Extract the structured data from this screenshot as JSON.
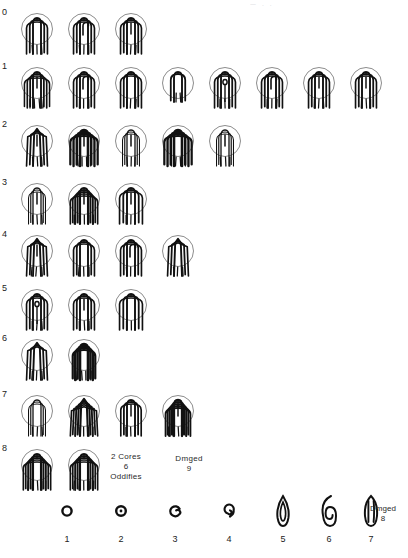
{
  "document": {
    "title": "Fingerprint ridge-pattern classification sheet",
    "top_edge_marks": "— .          .",
    "ink_color": "#111111",
    "circle_color": "#6f6f6f",
    "paper_color": "#ffffff"
  },
  "rows": [
    {
      "label": "0",
      "top": 8,
      "count": 3,
      "variants": [
        "loop-plain",
        "loop-hook",
        "loop-double-rod"
      ]
    },
    {
      "label": "1",
      "top": 62,
      "count": 8,
      "variants": [
        "loop-triple-rod",
        "loop-hook-rods",
        "loop-nested-arch",
        "loop-short-plain",
        "loop-eye-core",
        "loop-hook-left",
        "loop-rod-core",
        "loop-spiral-core"
      ]
    },
    {
      "label": "2",
      "top": 120,
      "count": 5,
      "variants": [
        "arch-tented-rods",
        "arch-heavy-rods",
        "loop-thin-rods",
        "arch-bold-core",
        "loop-narrow-rods"
      ]
    },
    {
      "label": "3",
      "top": 178,
      "count": 3,
      "variants": [
        "loop-fine-rods",
        "arch-cage-rods",
        "loop-wide-rods"
      ]
    },
    {
      "label": "4",
      "top": 230,
      "count": 4,
      "variants": [
        "tented-arch-rods",
        "loop-plain-open",
        "loop-hook-open",
        "tented-arch-split"
      ]
    },
    {
      "label": "5",
      "top": 284,
      "count": 3,
      "variants": [
        "loop-eye-core",
        "loop-twin-rods",
        "loop-plain-wide"
      ]
    },
    {
      "label": "6",
      "top": 334,
      "count": 2,
      "variants": [
        "tented-arch-split",
        "arch-bold-cage"
      ]
    },
    {
      "label": "7",
      "top": 390,
      "count": 4,
      "variants": [
        "arch-cage-fine",
        "tented-arch-cage",
        "arch-leaning-rods",
        "arch-dense-rods"
      ]
    },
    {
      "label": "8",
      "top": 444,
      "count": 2,
      "variants": [
        "arch-cage-alt",
        "arch-cage-tall"
      ]
    }
  ],
  "annotations": [
    {
      "name": "cores-oddities-note",
      "text": "2 Cores\n6\nOddifies",
      "left": 98,
      "top": 452,
      "width": 56
    },
    {
      "name": "damaged-note-9",
      "text": "Dmged\n9",
      "left": 166,
      "top": 454,
      "width": 46
    }
  ],
  "legend": {
    "items": [
      {
        "number": "1",
        "glyph": "whorl-ring",
        "left": 44
      },
      {
        "number": "2",
        "glyph": "whorl-ring-dot",
        "left": 98
      },
      {
        "number": "3",
        "glyph": "whorl-spiral-open",
        "left": 152
      },
      {
        "number": "4",
        "glyph": "whorl-spiral-tail",
        "left": 206
      },
      {
        "number": "5",
        "glyph": "whorl-ellipse-single",
        "left": 260
      },
      {
        "number": "6",
        "glyph": "whorl-ellipse-double",
        "left": 306
      },
      {
        "number": "7",
        "glyph": "whorl-ellipse-triple",
        "left": 348
      }
    ],
    "note": {
      "name": "damaged-note-8",
      "text": "Dmged\n8"
    }
  }
}
